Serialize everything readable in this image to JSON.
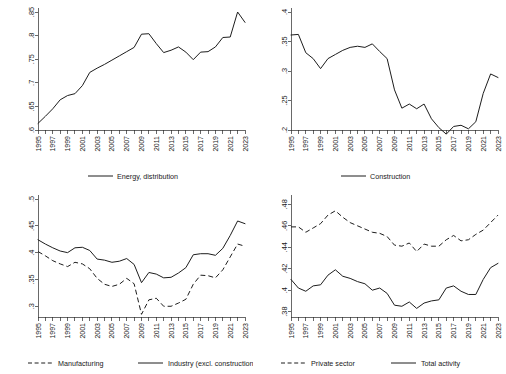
{
  "figure": {
    "background": "#ffffff",
    "line_color": "#1d1d1d",
    "panel_count": 4
  },
  "chart_data": [
    {
      "panel": "top-left",
      "type": "line",
      "title": "",
      "xlabel": "",
      "ylabel": "",
      "grid": false,
      "legend_position": "bottom",
      "xlim": [
        1995,
        2023
      ],
      "ylim": [
        0.6,
        0.85
      ],
      "yticks": [
        ".6",
        ".65",
        ".7",
        ".75",
        ".8",
        ".85"
      ],
      "xticks": [
        "1995",
        "1997",
        "1999",
        "2001",
        "2003",
        "2005",
        "2007",
        "2009",
        "2011",
        "2013",
        "2015",
        "2017",
        "2019",
        "2021",
        "2023"
      ],
      "x": [
        1995,
        1996,
        1997,
        1998,
        1999,
        2000,
        2001,
        2002,
        2003,
        2004,
        2005,
        2006,
        2007,
        2008,
        2009,
        2010,
        2011,
        2012,
        2013,
        2014,
        2015,
        2016,
        2017,
        2018,
        2019,
        2020,
        2021,
        2022,
        2023
      ],
      "series": [
        {
          "name": "Energy, distribution",
          "style": "solid",
          "values": [
            0.614,
            0.629,
            0.645,
            0.664,
            0.673,
            0.677,
            0.694,
            0.722,
            0.731,
            0.739,
            0.748,
            0.757,
            0.766,
            0.775,
            0.803,
            0.804,
            0.783,
            0.764,
            0.769,
            0.776,
            0.765,
            0.749,
            0.765,
            0.766,
            0.776,
            0.796,
            0.797,
            0.85,
            0.828
          ]
        }
      ]
    },
    {
      "panel": "top-right",
      "type": "line",
      "title": "",
      "xlabel": "",
      "ylabel": "",
      "grid": false,
      "legend_position": "bottom",
      "xlim": [
        1995,
        2023
      ],
      "ylim": [
        0.2,
        0.4
      ],
      "yticks": [
        ".2",
        ".25",
        ".3",
        ".35",
        ".4"
      ],
      "xticks": [
        "1995",
        "1997",
        "1999",
        "2001",
        "2003",
        "2005",
        "2007",
        "2009",
        "2011",
        "2013",
        "2015",
        "2017",
        "2019",
        "2021",
        "2023"
      ],
      "x": [
        1995,
        1996,
        1997,
        1998,
        1999,
        2000,
        2001,
        2002,
        2003,
        2004,
        2005,
        2006,
        2007,
        2008,
        2009,
        2010,
        2011,
        2012,
        2013,
        2014,
        2015,
        2016,
        2017,
        2018,
        2019,
        2020,
        2021,
        2022,
        2023
      ],
      "series": [
        {
          "name": "Construction",
          "style": "solid",
          "values": [
            0.361,
            0.362,
            0.331,
            0.321,
            0.304,
            0.321,
            0.328,
            0.335,
            0.34,
            0.342,
            0.34,
            0.346,
            0.333,
            0.321,
            0.268,
            0.237,
            0.244,
            0.236,
            0.244,
            0.219,
            0.204,
            0.193,
            0.206,
            0.208,
            0.202,
            0.214,
            0.262,
            0.295,
            0.289
          ]
        }
      ]
    },
    {
      "panel": "bottom-left",
      "type": "line",
      "title": "",
      "xlabel": "",
      "ylabel": "",
      "grid": false,
      "legend_position": "bottom",
      "xlim": [
        1995,
        2023
      ],
      "ylim": [
        0.28,
        0.5
      ],
      "yticks": [
        ".3",
        ".35",
        ".4",
        ".45",
        ".5"
      ],
      "xticks": [
        "1995",
        "1997",
        "1999",
        "2001",
        "2003",
        "2005",
        "2007",
        "2009",
        "2011",
        "2013",
        "2015",
        "2017",
        "2019",
        "2021",
        "2023"
      ],
      "x": [
        1995,
        1996,
        1997,
        1998,
        1999,
        2000,
        2001,
        2002,
        2003,
        2004,
        2005,
        2006,
        2007,
        2008,
        2009,
        2010,
        2011,
        2012,
        2013,
        2014,
        2015,
        2016,
        2017,
        2018,
        2019,
        2020,
        2021,
        2022,
        2023
      ],
      "series": [
        {
          "name": "Industry (excl. construction)",
          "style": "solid",
          "values": [
            0.424,
            0.416,
            0.409,
            0.403,
            0.4,
            0.409,
            0.41,
            0.404,
            0.388,
            0.386,
            0.382,
            0.384,
            0.389,
            0.378,
            0.344,
            0.363,
            0.36,
            0.353,
            0.354,
            0.362,
            0.372,
            0.396,
            0.398,
            0.398,
            0.395,
            0.408,
            0.432,
            0.459,
            0.454
          ]
        },
        {
          "name": "Manufacturing",
          "style": "dashed",
          "values": [
            0.402,
            0.394,
            0.385,
            0.379,
            0.374,
            0.382,
            0.379,
            0.37,
            0.352,
            0.341,
            0.337,
            0.341,
            0.352,
            0.342,
            0.285,
            0.312,
            0.315,
            0.3,
            0.3,
            0.306,
            0.313,
            0.341,
            0.358,
            0.357,
            0.353,
            0.368,
            0.392,
            0.416,
            0.412
          ]
        }
      ]
    },
    {
      "panel": "bottom-right",
      "type": "line",
      "title": "",
      "xlabel": "",
      "ylabel": "",
      "grid": false,
      "legend_position": "bottom",
      "xlim": [
        1995,
        2023
      ],
      "ylim": [
        0.375,
        0.485
      ],
      "yticks": [
        ".38",
        ".4",
        ".42",
        ".44",
        ".46",
        ".48"
      ],
      "xticks": [
        "1995",
        "1997",
        "1999",
        "2001",
        "2003",
        "2005",
        "2007",
        "2009",
        "2011",
        "2013",
        "2015",
        "2017",
        "2019",
        "2021",
        "2023"
      ],
      "x": [
        1995,
        1996,
        1997,
        1998,
        1999,
        2000,
        2001,
        2002,
        2003,
        2004,
        2005,
        2006,
        2007,
        2008,
        2009,
        2010,
        2011,
        2012,
        2013,
        2014,
        2015,
        2016,
        2017,
        2018,
        2019,
        2020,
        2021,
        2022,
        2023
      ],
      "series": [
        {
          "name": "Total activity",
          "style": "solid",
          "values": [
            0.41,
            0.402,
            0.399,
            0.404,
            0.405,
            0.414,
            0.419,
            0.413,
            0.411,
            0.408,
            0.406,
            0.4,
            0.402,
            0.397,
            0.386,
            0.385,
            0.389,
            0.383,
            0.388,
            0.39,
            0.391,
            0.402,
            0.404,
            0.399,
            0.396,
            0.396,
            0.41,
            0.421,
            0.425
          ]
        },
        {
          "name": "Private sector",
          "style": "dashed",
          "values": [
            0.459,
            0.459,
            0.454,
            0.458,
            0.462,
            0.47,
            0.474,
            0.468,
            0.463,
            0.46,
            0.457,
            0.454,
            0.453,
            0.45,
            0.442,
            0.441,
            0.444,
            0.436,
            0.443,
            0.441,
            0.441,
            0.447,
            0.451,
            0.446,
            0.447,
            0.452,
            0.456,
            0.463,
            0.47
          ]
        }
      ]
    }
  ]
}
